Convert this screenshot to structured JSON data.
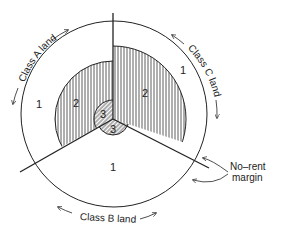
{
  "diagram": {
    "sectors": [
      {
        "name": "Class A land",
        "region_labels": [
          "1",
          "2",
          "3"
        ]
      },
      {
        "name": "Class B land",
        "region_labels": [
          "1",
          "3"
        ]
      },
      {
        "name": "Class C land",
        "region_labels": [
          "1",
          "2"
        ]
      }
    ],
    "labels": {
      "class_a": "Class A land",
      "class_b": "Class B land",
      "class_c": "Class C land",
      "a1": "1",
      "a2": "2",
      "a3": "3",
      "b1": "1",
      "b3": "3",
      "c1": "1",
      "c2": "2",
      "no_rent_line1": "No–rent",
      "no_rent_line2": "margin"
    },
    "colors": {
      "stroke": "#222222",
      "background": "#ffffff"
    }
  }
}
